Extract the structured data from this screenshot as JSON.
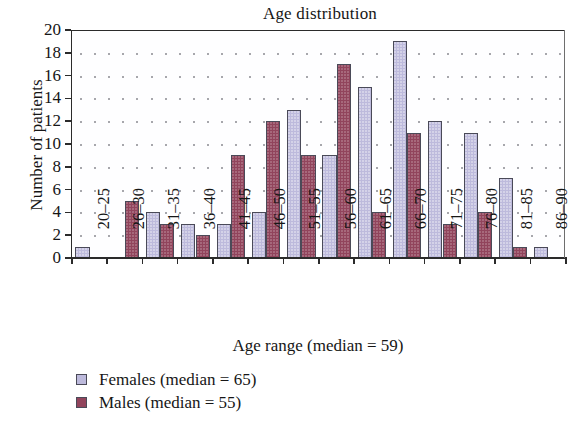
{
  "chart_data": {
    "type": "bar",
    "title": "Age distribution",
    "xlabel": "Age range (median = 59)",
    "ylabel": "Number of patients",
    "categories": [
      "20–25",
      "26–30",
      "31–35",
      "36–40",
      "41–45",
      "46–50",
      "51–55",
      "56–60",
      "61–65",
      "66–70",
      "71–75",
      "76–80",
      "81–85",
      "86–90"
    ],
    "series": [
      {
        "name": "Females (median = 65)",
        "color": "#bdbadc",
        "values": [
          1,
          0,
          4,
          3,
          3,
          4,
          13,
          9,
          15,
          19,
          12,
          11,
          7,
          1
        ]
      },
      {
        "name": "Males (median = 55)",
        "color": "#91445c",
        "values": [
          0,
          5,
          3,
          2,
          9,
          12,
          9,
          17,
          4,
          11,
          3,
          4,
          1,
          0
        ]
      }
    ],
    "ylim": [
      0,
      20
    ],
    "yticks": [
      0,
      2,
      4,
      6,
      8,
      10,
      12,
      14,
      16,
      18,
      20
    ],
    "grid": "dotted-horizontal",
    "legend_position": "below-left"
  },
  "legend": {
    "entries": [
      {
        "label": "Females (median = 65)"
      },
      {
        "label": "Males (median = 55)"
      }
    ]
  }
}
